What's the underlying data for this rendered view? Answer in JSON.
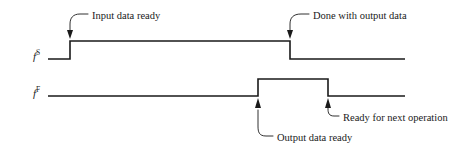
{
  "diagram": {
    "type": "timing-diagram",
    "width": 468,
    "height": 151,
    "background_color": "#ffffff",
    "line_color": "#1a1a1a",
    "signals": [
      {
        "id": "fS",
        "label_base": "f",
        "label_sup": "S",
        "label_x": 33,
        "label_y": 51,
        "low_y": 59,
        "high_y": 41,
        "start_x": 48,
        "end_x": 405,
        "transitions": [
          {
            "x": 70,
            "edge": "rising"
          },
          {
            "x": 290,
            "edge": "falling"
          }
        ]
      },
      {
        "id": "fF",
        "label_base": "f",
        "label_sup": "F",
        "label_x": 33,
        "label_y": 88,
        "low_y": 96,
        "high_y": 79,
        "start_x": 48,
        "end_x": 405,
        "transitions": [
          {
            "x": 258,
            "edge": "rising"
          },
          {
            "x": 328,
            "edge": "falling"
          }
        ]
      }
    ],
    "annotations": [
      {
        "id": "input-data-ready",
        "text": "Input data ready",
        "text_x": 92,
        "text_y": 11,
        "target_x": 70,
        "target_y": 38,
        "arrow": "down"
      },
      {
        "id": "done-with-output-data",
        "text": "Done with output data",
        "text_x": 313,
        "text_y": 11,
        "target_x": 290,
        "target_y": 38,
        "arrow": "down"
      },
      {
        "id": "output-data-ready",
        "text": "Output data ready",
        "text_x": 277,
        "text_y": 133,
        "target_x": 258,
        "target_y": 99,
        "arrow": "up"
      },
      {
        "id": "ready-for-next-operation",
        "text": "Ready for next operation",
        "text_x": 343,
        "text_y": 113,
        "target_x": 328,
        "target_y": 99,
        "arrow": "up"
      }
    ]
  }
}
